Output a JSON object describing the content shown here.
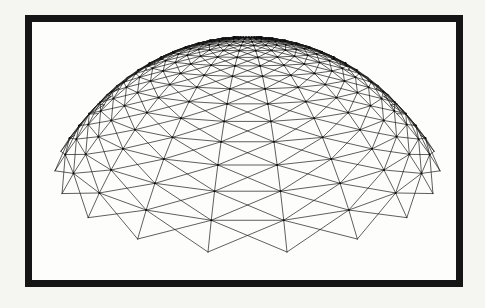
{
  "page": {
    "width": 485,
    "height": 308,
    "background": "#f5f5f2"
  },
  "frame": {
    "x": 25,
    "y": 15,
    "width": 438,
    "height": 272,
    "border_width": 7,
    "border_color": "#151515",
    "background": "#fdfdfb"
  },
  "diagram": {
    "type": "wireframe-dome",
    "line_color": "#1b1b1b",
    "line_opacity": 0.88,
    "line_width": 0.8,
    "node_color": "#0c0c0c",
    "node_radius": 1.05,
    "node_opacity": 0.92,
    "mesh": {
      "sectors": 30,
      "rings": 16,
      "phi_start_deg": 4,
      "phi_end_deg": 58,
      "omit_outer_ring_line": true,
      "draw_radials": true,
      "draw_both_diagonals": true
    },
    "camera": {
      "horizontal_distance": 1.35,
      "height": 1.02,
      "look_at": [
        0,
        0,
        0.8
      ],
      "cull_tolerance": -0.1,
      "node_visibility_tolerance": 0.0
    },
    "target_box": {
      "x": 55,
      "y": 37,
      "width": 385,
      "height": 215
    }
  }
}
